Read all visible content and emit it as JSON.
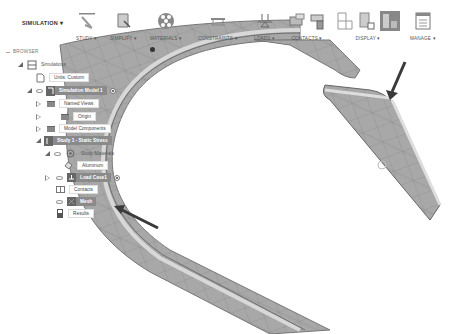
{
  "toolbar": {
    "workspace": "SIMULATION ▾",
    "groups": [
      {
        "id": "study",
        "label": "STUDY ▾",
        "icon": "study-icon"
      },
      {
        "id": "simplify",
        "label": "SIMPLIFY ▾",
        "icon": "simplify-icon"
      },
      {
        "id": "materials",
        "label": "MATERIALS ▾",
        "icon": "materials-icon"
      },
      {
        "id": "constraints",
        "label": "CONSTRAINTS ▾",
        "icon": "constraints-icon"
      },
      {
        "id": "loads",
        "label": "LOADS ▾",
        "icon": "loads-icon"
      },
      {
        "id": "contacts",
        "label": "CONTACTS ▾",
        "icon": "contacts-icon"
      },
      {
        "id": "display",
        "label": "DISPLAY ▾",
        "icon": "display-icon"
      },
      {
        "id": "manage",
        "label": "MANAGE ▾",
        "icon": "manage-icon"
      }
    ]
  },
  "browser": {
    "title": "BROWSER",
    "items": [
      {
        "label": "Simulations",
        "level": 0
      },
      {
        "label": "Units: Custom",
        "level": 1
      },
      {
        "label": "Simulation Model 1",
        "level": 1,
        "highlighted": true
      },
      {
        "label": "Named Views",
        "level": 2
      },
      {
        "label": "Origin",
        "level": 2
      },
      {
        "label": "Model Components",
        "level": 2
      },
      {
        "label": "Study 1 - Static Stress",
        "level": 1,
        "highlighted": true
      },
      {
        "label": "Study Materials",
        "level": 2
      },
      {
        "label": "Aluminum",
        "level": 3
      },
      {
        "label": "Load Case1",
        "level": 2,
        "highlighted": true
      },
      {
        "label": "Contacts",
        "level": 2
      },
      {
        "label": "Mesh",
        "level": 2,
        "highlighted": true
      },
      {
        "label": "Results",
        "level": 2
      }
    ]
  },
  "colors": {
    "mesh_fill": "#a6a6a6",
    "mesh_edge": "#7a7a7a",
    "highlight": "#8a8a8a",
    "arrow": "#3a3a3a"
  }
}
